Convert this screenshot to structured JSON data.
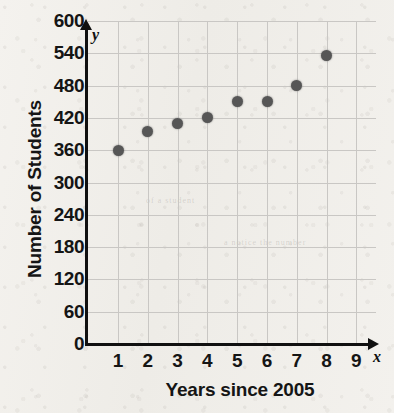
{
  "chart_data": {
    "type": "scatter",
    "title": "",
    "xlabel": "Years since 2005",
    "ylabel": "Number of Students",
    "x_var_label": "x",
    "y_var_label": "y",
    "x": [
      1,
      2,
      3,
      4,
      5,
      6,
      7,
      8
    ],
    "values": [
      360,
      395,
      410,
      420,
      450,
      450,
      480,
      535
    ],
    "points": [
      {
        "x": 1,
        "y": 360
      },
      {
        "x": 2,
        "y": 395
      },
      {
        "x": 3,
        "y": 410
      },
      {
        "x": 4,
        "y": 420
      },
      {
        "x": 5,
        "y": 450
      },
      {
        "x": 6,
        "y": 450
      },
      {
        "x": 7,
        "y": 480
      },
      {
        "x": 8,
        "y": 535
      }
    ],
    "xlim": [
      0,
      9.6
    ],
    "ylim": [
      0,
      600
    ],
    "x_ticks": [
      "1",
      "2",
      "3",
      "4",
      "5",
      "6",
      "7",
      "8",
      "9"
    ],
    "y_ticks": [
      "0",
      "60",
      "120",
      "180",
      "240",
      "300",
      "360",
      "420",
      "480",
      "540",
      "600"
    ],
    "grid": true,
    "legend": "none",
    "point_color": "#565656",
    "axis_color": "#101010",
    "grid_color": "#c9c7c4",
    "background_color": "#f2f0ec"
  },
  "bleed_text": {
    "line1": "of a student",
    "line2": "a notice the number"
  }
}
